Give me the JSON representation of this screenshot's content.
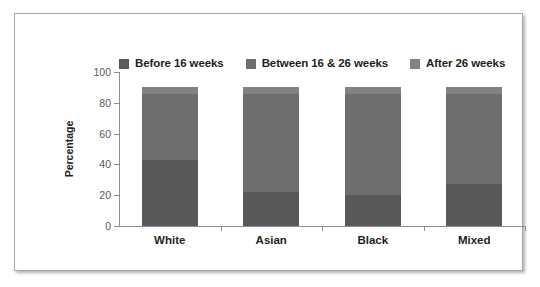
{
  "chart_data": {
    "type": "bar",
    "subtype": "stacked-bar",
    "title": "",
    "xlabel": "",
    "ylabel": "Percentage",
    "ylim": [
      0,
      100
    ],
    "yticks": [
      0,
      20,
      40,
      60,
      80,
      100
    ],
    "grid": false,
    "legend_position": "top",
    "categories": [
      "White",
      "Asian",
      "Black",
      "Mixed"
    ],
    "series": [
      {
        "name": "Before 16 weeks",
        "color": "#58595b",
        "values": [
          43,
          22,
          20,
          27
        ]
      },
      {
        "name": "Between 16 & 26 weeks",
        "color": "#6d6e70",
        "values": [
          43,
          64,
          66,
          59
        ]
      },
      {
        "name": "After 26 weeks",
        "color": "#808285",
        "values": [
          4,
          4,
          4,
          4
        ]
      }
    ],
    "totals": [
      90,
      90,
      90,
      90
    ]
  },
  "axis": {
    "y_tick_labels": [
      "0",
      "20",
      "40",
      "60",
      "80",
      "100"
    ],
    "y_axis_title": "Percentage"
  },
  "legend": {
    "entries": [
      {
        "label": "Before 16 weeks",
        "color": "#58595b"
      },
      {
        "label": "Between 16 & 26 weeks",
        "color": "#6d6e70"
      },
      {
        "label": "After 26 weeks",
        "color": "#808285"
      }
    ]
  },
  "colors": {
    "frame_border": "#a9a9ab",
    "axis": "#8c8c8e",
    "text": "#231f20",
    "tick_text": "#58595b",
    "background": "#ffffff"
  }
}
